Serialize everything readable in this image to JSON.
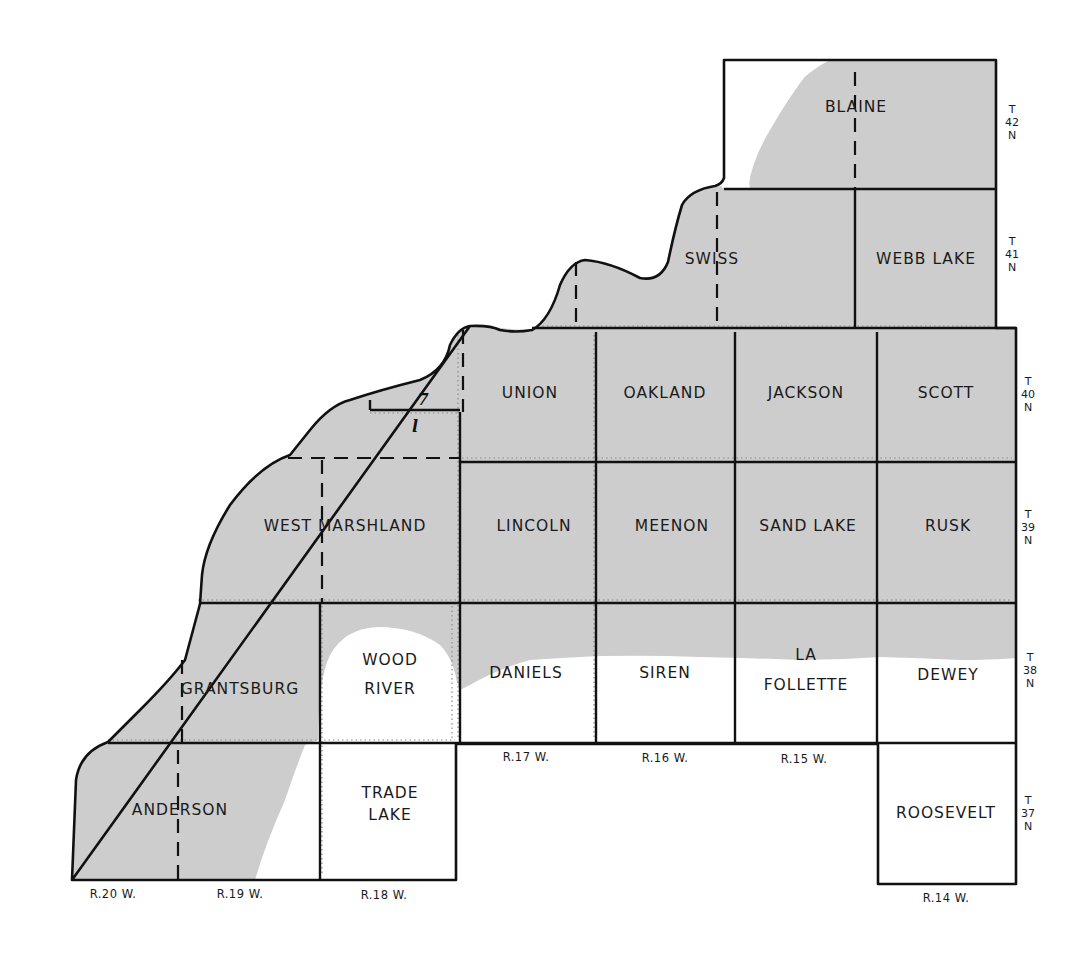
{
  "map": {
    "subject": "Township map",
    "colors": {
      "shaded_area": "#cdcdcd",
      "unshaded_area": "#ffffff",
      "lines": "#111111"
    },
    "townships": [
      {
        "name": "BLAINE",
        "row": "T42N",
        "col": "R14W-R15W"
      },
      {
        "name": "SWISS",
        "row": "T41N",
        "col": "R15W-R16W"
      },
      {
        "name": "WEBB LAKE",
        "row": "T41N",
        "col": "R14W"
      },
      {
        "name": "UNION",
        "row": "T40N",
        "col": "R17W"
      },
      {
        "name": "OAKLAND",
        "row": "T40N",
        "col": "R16W"
      },
      {
        "name": "JACKSON",
        "row": "T40N",
        "col": "R15W"
      },
      {
        "name": "SCOTT",
        "row": "T40N",
        "col": "R14W"
      },
      {
        "name": "WEST MARSHLAND",
        "row": "T39N",
        "col": "R18W-R19W"
      },
      {
        "name": "LINCOLN",
        "row": "T39N",
        "col": "R17W"
      },
      {
        "name": "MEENON",
        "row": "T39N",
        "col": "R16W"
      },
      {
        "name": "SAND LAKE",
        "row": "T39N",
        "col": "R15W"
      },
      {
        "name": "RUSK",
        "row": "T39N",
        "col": "R14W"
      },
      {
        "name": "GRANTSBURG",
        "row": "T38N",
        "col": "R19W"
      },
      {
        "name": "WOOD",
        "name_line2": "RIVER",
        "row": "T38N",
        "col": "R18W"
      },
      {
        "name": "DANIELS",
        "row": "T38N",
        "col": "R17W"
      },
      {
        "name": "SIREN",
        "row": "T38N",
        "col": "R16W"
      },
      {
        "name": "LA",
        "name_line2": "FOLLETTE",
        "row": "T38N",
        "col": "R15W"
      },
      {
        "name": "DEWEY",
        "row": "T38N",
        "col": "R14W"
      },
      {
        "name": "ANDERSON",
        "row": "T37N",
        "col": "R19W"
      },
      {
        "name": "TRADE",
        "name_line2": "LAKE",
        "row": "T37N",
        "col": "R18W"
      },
      {
        "name": "ROOSEVELT",
        "row": "T37N",
        "col": "R14W"
      }
    ],
    "township_labels": [
      {
        "t": "T",
        "num": "42",
        "n": "N"
      },
      {
        "t": "T",
        "num": "41",
        "n": "N"
      },
      {
        "t": "T",
        "num": "40",
        "n": "N"
      },
      {
        "t": "T",
        "num": "39",
        "n": "N"
      },
      {
        "t": "T",
        "num": "38",
        "n": "N"
      },
      {
        "t": "T",
        "num": "37",
        "n": "N"
      }
    ],
    "range_labels": [
      "R.20 W.",
      "R.19 W.",
      "R.18 W.",
      "R.17 W.",
      "R.16 W.",
      "R.15 W.",
      "R.14 W."
    ],
    "markers": {
      "upper": "7",
      "lower": "l"
    }
  }
}
